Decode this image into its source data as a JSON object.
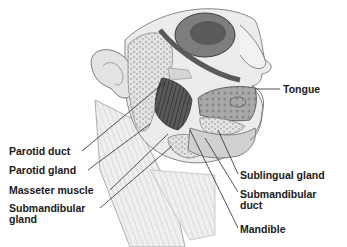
{
  "diagram": {
    "labels": {
      "tongue": "Tongue",
      "parotid_duct": "Parotid duct",
      "parotid_gland": "Parotid gland",
      "masseter_muscle": "Masseter muscle",
      "submandibular_gland_1": "Submandibular",
      "submandibular_gland_2": "gland",
      "sublingual_gland": "Sublingual gland",
      "submandibular_duct_1": "Submandibular",
      "submandibular_duct_2": "duct",
      "mandible": "Mandible"
    },
    "colors": {
      "background": "#ffffff",
      "line": "#2a2a2a",
      "text": "#1a1a1a",
      "tissue_light": "#d9d9d9",
      "tissue_mid": "#9a9a9a",
      "tissue_dark": "#3c3c3c"
    }
  }
}
